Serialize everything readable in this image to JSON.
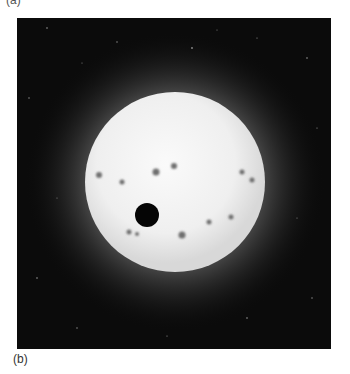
{
  "figure": {
    "top_label": "(a)",
    "bottom_label": "(b)",
    "image_description": "Star with sunspots and a dark transiting planet against a starry background",
    "colors": {
      "background": "#0b0b0b",
      "star_core": "#f4f4f4",
      "star_glow": "#9a9a9a",
      "planet": "#050505",
      "sunspot": "#6e6e6e"
    }
  }
}
